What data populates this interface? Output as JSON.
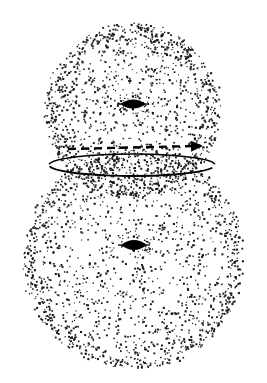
{
  "figure": {
    "background_color": "#ffffff",
    "point_color": "#1a1a1a",
    "line_color": "#000000",
    "width": 267,
    "height": 383,
    "caption": ""
  },
  "chart_data": {
    "type": "scatter",
    "subtitle": "",
    "xlabel": "",
    "ylabel": "",
    "xlim": [
      0,
      267
    ],
    "ylim": [
      0,
      383
    ],
    "grid": false,
    "legend": "none",
    "annotations": [
      {
        "name": "dashed-arrow",
        "kind": "arrow",
        "style": "dashed",
        "x1": 68,
        "y1": 149,
        "x2": 203,
        "y2": 146,
        "arrowhead": "right",
        "label": ""
      },
      {
        "name": "intersection-ellipse",
        "kind": "ellipse-arc",
        "style": "solid",
        "cx": 132,
        "cy": 165,
        "rx": 83,
        "ry": 11,
        "label": ""
      }
    ],
    "series": [
      {
        "name": "upper-sphere-shell",
        "marker": "dot",
        "shape": "sphere-shell",
        "center": [
          132,
          110
        ],
        "radius": 88,
        "n_points": 1400,
        "shell_bias": 0.82,
        "color": "#1a1a1a",
        "point_size": 1.35
      },
      {
        "name": "lower-sphere-shell",
        "marker": "dot",
        "shape": "sphere-shell",
        "center": [
          133,
          258
        ],
        "radius": 111,
        "n_points": 1700,
        "shell_bias": 0.84,
        "color": "#1a1a1a",
        "point_size": 1.35
      },
      {
        "name": "upper-sphere-core",
        "marker": "lens",
        "shape": "lens-marker",
        "center": [
          133,
          104
        ],
        "width": 26,
        "height": 9,
        "color": "#000000"
      },
      {
        "name": "lower-sphere-core",
        "marker": "lens",
        "shape": "lens-marker",
        "center": [
          134,
          245
        ],
        "width": 26,
        "height": 10,
        "color": "#000000"
      }
    ]
  }
}
